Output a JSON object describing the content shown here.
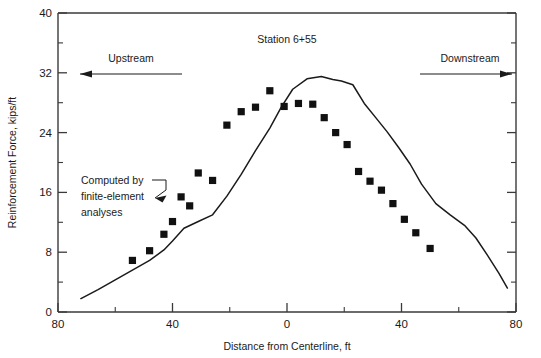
{
  "figure": {
    "background_color": "#ffffff",
    "line_color": "#1a1a1a",
    "marker_color": "#111111",
    "axis_color": "#3a3a3a"
  },
  "annotations": {
    "station_label": "Station 6+55",
    "upstream_label": "Upstream",
    "downstream_label": "Downstream",
    "computed_line1": "Computed by",
    "computed_line2": "finite-element",
    "computed_line3": "analyses"
  },
  "chart_data": {
    "type": "line",
    "title": "",
    "subtitle": "",
    "xlabel": "Distance from Centerline, ft",
    "ylabel": "Reinforcement Force, kips/ft",
    "xlim": [
      -80,
      80
    ],
    "ylim": [
      0,
      40
    ],
    "grid": false,
    "legend": "none",
    "x_tick_labels": [
      "80",
      "40",
      "0",
      "40",
      "80"
    ],
    "x_tick_values": [
      -80,
      -40,
      0,
      40,
      80
    ],
    "x_minor_tick_values": [
      -60,
      -20,
      20,
      60
    ],
    "y_tick_labels": [
      "0",
      "8",
      "16",
      "24",
      "32",
      "40"
    ],
    "y_tick_values": [
      0,
      8,
      16,
      24,
      32,
      40
    ],
    "y_minor_tick_values": [
      4,
      12,
      20,
      28,
      36
    ],
    "x_axis_note": "axis runs from 80 (upstream, left) through 0 (centerline) to 80 (downstream, right)",
    "series": [
      {
        "name": "Computed by finite-element analyses",
        "style": "line",
        "x": [
          -72,
          -66,
          -60,
          -54,
          -48,
          -43,
          -40,
          -36,
          -31,
          -26,
          -21,
          -16,
          -11,
          -6,
          -2,
          2,
          7,
          12,
          16,
          19,
          23,
          27,
          31,
          35,
          39,
          43,
          47,
          52,
          57,
          62,
          66,
          70,
          74,
          77
        ],
        "y": [
          1.8,
          3.0,
          4.3,
          5.6,
          6.9,
          8.3,
          9.5,
          11.2,
          12.1,
          13.0,
          15.5,
          18.4,
          21.6,
          24.6,
          27.4,
          29.8,
          31.2,
          31.5,
          31.1,
          30.9,
          30.4,
          27.9,
          26.0,
          24.1,
          22.0,
          19.8,
          17.1,
          14.5,
          13.0,
          11.6,
          9.9,
          7.6,
          5.2,
          3.2
        ]
      },
      {
        "name": "Measured",
        "style": "scatter-square",
        "x": [
          -54,
          -48,
          -43,
          -40,
          -37,
          -34,
          -31,
          -26,
          -21,
          -16,
          -11,
          -6,
          -1,
          4,
          9,
          13,
          17,
          21,
          25,
          29,
          33,
          37,
          41,
          45,
          50
        ],
        "y": [
          6.9,
          8.2,
          10.4,
          12.1,
          15.4,
          14.2,
          18.6,
          17.6,
          25.0,
          26.8,
          27.4,
          29.6,
          27.5,
          27.9,
          27.8,
          26.0,
          24.0,
          22.4,
          18.8,
          17.5,
          16.3,
          14.5,
          12.4,
          10.6,
          8.5
        ]
      }
    ]
  }
}
